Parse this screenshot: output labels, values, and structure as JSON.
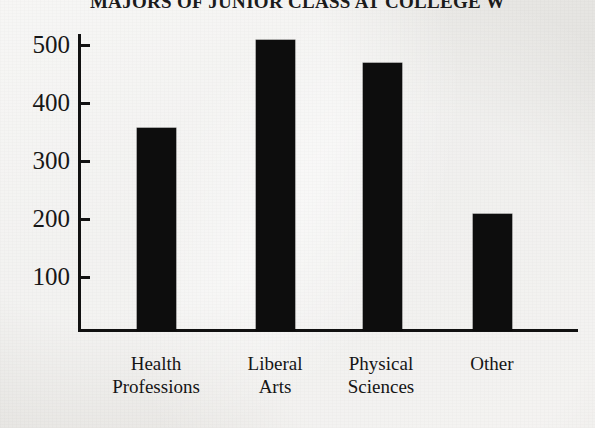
{
  "chart_data": {
    "type": "bar",
    "title": "MAJORS OF JUNIOR CLASS AT COLLEGE W",
    "xlabel": "",
    "ylabel": "",
    "categories": [
      "Health Professions",
      "Liberal Arts",
      "Physical Sciences",
      "Other"
    ],
    "category_lines": [
      [
        "Health",
        "Professions"
      ],
      [
        "Liberal",
        "Arts"
      ],
      [
        "Physical",
        "Sciences"
      ],
      [
        "Other",
        ""
      ]
    ],
    "values": [
      348,
      500,
      460,
      200
    ],
    "ylim": [
      0,
      560
    ],
    "yticks": [
      100,
      200,
      300,
      400,
      500
    ],
    "ytick_labels": [
      "100",
      "200",
      "300",
      "400",
      "500"
    ],
    "grid": false,
    "legend": null,
    "bar_color": "#0d0d0d",
    "axis_color": "#111111",
    "background_color": "#e8e8e6"
  }
}
